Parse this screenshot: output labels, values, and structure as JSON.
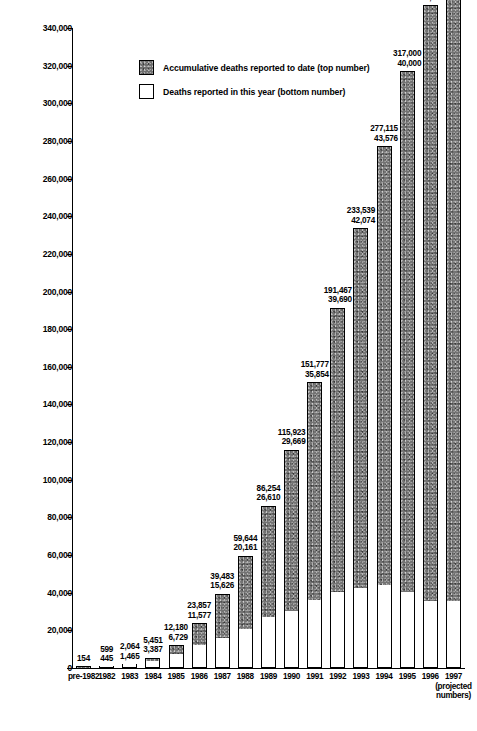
{
  "chart_data": {
    "type": "bar",
    "title": "",
    "subtitle": "",
    "xlabel": "",
    "ylabel": "",
    "ylim": [
      0,
      350000
    ],
    "ytick_step": 20000,
    "grid": false,
    "stacked": true,
    "legend_position": "top-center",
    "categories": [
      "pre-1982",
      "1982",
      "1983",
      "1984",
      "1985",
      "1986",
      "1987",
      "1988",
      "1989",
      "1990",
      "1991",
      "1992",
      "1993",
      "1994",
      "1995",
      "1996",
      "1997"
    ],
    "category_sublabels": [
      "",
      "",
      "",
      "",
      "",
      "",
      "",
      "",
      "",
      "",
      "",
      "",
      "",
      "",
      "",
      "",
      "(projected\nnumbers)"
    ],
    "ytick_labels": [
      "0",
      "20,000",
      "40,000",
      "60,000",
      "80,000",
      "100,000",
      "120,000",
      "140,000",
      "160,000",
      "180,000",
      "200,000",
      "220,000",
      "240,000",
      "260,000",
      "280,000",
      "300,000",
      "320,000",
      "340,000"
    ],
    "ytick_values": [
      0,
      20000,
      40000,
      60000,
      80000,
      100000,
      120000,
      140000,
      160000,
      180000,
      200000,
      220000,
      240000,
      260000,
      280000,
      300000,
      320000,
      340000
    ],
    "series": [
      {
        "name": "Accumulative deaths reported to date (top number)",
        "key": "cumulative",
        "color": "#737373",
        "values": [
          154,
          599,
          2064,
          5451,
          12180,
          23857,
          39483,
          59644,
          86254,
          115923,
          151777,
          191467,
          233539,
          277115,
          317000,
          352000,
          387000
        ],
        "value_labels": [
          "154",
          "599",
          "2,064",
          "5,451",
          "12,180",
          "23,857",
          "39,483",
          "59,644",
          "86,254",
          "115,923",
          "151,777",
          "191,467",
          "233,539",
          "277,115",
          "317,000",
          "352,000",
          "387,000"
        ]
      },
      {
        "name": "Deaths reported in this year (bottom number)",
        "key": "annual",
        "color": "#ffffff",
        "values": [
          null,
          445,
          1465,
          3387,
          6729,
          11577,
          15626,
          20161,
          26610,
          29669,
          35854,
          39690,
          42074,
          43576,
          40000,
          35000,
          35000
        ],
        "value_labels": [
          "",
          "445",
          "1,465",
          "3,387",
          "6,729",
          "11,577",
          "15,626",
          "20,161",
          "26,610",
          "29,669",
          "35,854",
          "39,690",
          "42,074",
          "43,576",
          "40,000",
          "35,000",
          "35,000"
        ]
      }
    ]
  },
  "legend": {
    "items": [
      {
        "label": "Accumulative deaths reported to date (top number)",
        "swatch": "cumulative"
      },
      {
        "label": "Deaths reported in this year (bottom number)",
        "swatch": "annual"
      }
    ]
  }
}
